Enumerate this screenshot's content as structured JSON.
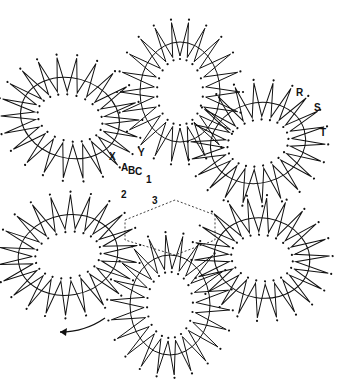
{
  "diagram": {
    "type": "bobbin-lace-pricking",
    "stroke_color": "#111111",
    "pin_color": "#111111",
    "petals": [
      {
        "name": "top",
        "cx": 180,
        "cy": 92,
        "rx": 40,
        "ry": 50,
        "rot": 0,
        "spikes": 22,
        "outer": 20,
        "inner": 14
      },
      {
        "name": "upper-left",
        "cx": 70,
        "cy": 118,
        "rx": 50,
        "ry": 40,
        "rot": 15,
        "spikes": 22,
        "outer": 20,
        "inner": 14
      },
      {
        "name": "upper-right",
        "cx": 258,
        "cy": 143,
        "rx": 48,
        "ry": 40,
        "rot": -15,
        "spikes": 22,
        "outer": 20,
        "inner": 14
      },
      {
        "name": "lower-left",
        "cx": 68,
        "cy": 255,
        "rx": 50,
        "ry": 40,
        "rot": -10,
        "spikes": 22,
        "outer": 20,
        "inner": 14
      },
      {
        "name": "lower-right",
        "cx": 262,
        "cy": 258,
        "rx": 48,
        "ry": 40,
        "rot": 10,
        "spikes": 22,
        "outer": 20,
        "inner": 14
      },
      {
        "name": "bottom",
        "cx": 170,
        "cy": 305,
        "rx": 40,
        "ry": 50,
        "rot": 0,
        "spikes": 22,
        "outer": 20,
        "inner": 14
      }
    ],
    "labels": [
      {
        "text": "R",
        "x": 296,
        "y": 88
      },
      {
        "text": "S",
        "x": 314,
        "y": 103
      },
      {
        "text": "T",
        "x": 320,
        "y": 128
      },
      {
        "text": "X",
        "x": 109,
        "y": 152
      },
      {
        "text": "Y",
        "x": 138,
        "y": 148
      },
      {
        "text": "A",
        "x": 121,
        "y": 163
      },
      {
        "text": "B",
        "x": 128,
        "y": 166
      },
      {
        "text": "C",
        "x": 135,
        "y": 167
      },
      {
        "text": "1",
        "x": 146,
        "y": 175
      },
      {
        "text": "2",
        "x": 121,
        "y": 190
      },
      {
        "text": "3",
        "x": 152,
        "y": 196
      }
    ],
    "direction_arrow": {
      "label": "working direction",
      "x1": 105,
      "y1": 318,
      "x2": 60,
      "y2": 332
    }
  }
}
